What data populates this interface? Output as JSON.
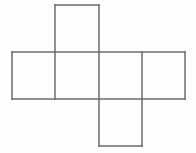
{
  "figure": {
    "type": "geometric-net",
    "shape_name": "cube net",
    "background_color": "#fdfdfd",
    "line_color": "#6b6b6b",
    "line_width": 1.5,
    "canvas": {
      "width": 196,
      "height": 153
    },
    "grid": {
      "cell_size": 43.3,
      "vertical_lines_x": [
        12,
        55,
        99,
        142,
        185
      ],
      "row_top_y": 5,
      "row_middle_top_y": 52,
      "row_middle_bottom_y": 99,
      "row_bottom_y": 146
    },
    "faces": [
      {
        "name": "top-face",
        "position": "top",
        "x": 55,
        "y": 5,
        "width": 44,
        "height": 47
      },
      {
        "name": "left-face",
        "position": "middle-1",
        "x": 12,
        "y": 52,
        "width": 43,
        "height": 47
      },
      {
        "name": "front-face",
        "position": "middle-2",
        "x": 55,
        "y": 52,
        "width": 44,
        "height": 47
      },
      {
        "name": "right-face",
        "position": "middle-3",
        "x": 99,
        "y": 52,
        "width": 43,
        "height": 47
      },
      {
        "name": "back-face",
        "position": "middle-4",
        "x": 142,
        "y": 52,
        "width": 43,
        "height": 47
      },
      {
        "name": "bottom-face",
        "position": "bottom",
        "x": 99,
        "y": 99,
        "width": 43,
        "height": 47
      }
    ],
    "edges": [
      {
        "name": "top-face-top-edge",
        "x1": 55,
        "y1": 5,
        "x2": 99,
        "y2": 5
      },
      {
        "name": "top-face-left-edge",
        "x1": 55,
        "y1": 5,
        "x2": 55,
        "y2": 52
      },
      {
        "name": "top-face-right-edge",
        "x1": 99,
        "y1": 5,
        "x2": 99,
        "y2": 52
      },
      {
        "name": "middle-row-top-edge",
        "x1": 12,
        "y1": 52,
        "x2": 185,
        "y2": 52
      },
      {
        "name": "middle-row-bottom-edge",
        "x1": 12,
        "y1": 99,
        "x2": 185,
        "y2": 99
      },
      {
        "name": "middle-divider-1",
        "x1": 12,
        "y1": 52,
        "x2": 12,
        "y2": 99
      },
      {
        "name": "middle-divider-2",
        "x1": 55,
        "y1": 52,
        "x2": 55,
        "y2": 99
      },
      {
        "name": "middle-divider-3",
        "x1": 99,
        "y1": 52,
        "x2": 99,
        "y2": 99
      },
      {
        "name": "middle-divider-4",
        "x1": 142,
        "y1": 52,
        "x2": 142,
        "y2": 99
      },
      {
        "name": "middle-divider-5",
        "x1": 185,
        "y1": 52,
        "x2": 185,
        "y2": 99
      },
      {
        "name": "bottom-face-left-edge",
        "x1": 99,
        "y1": 99,
        "x2": 99,
        "y2": 146
      },
      {
        "name": "bottom-face-right-edge",
        "x1": 142,
        "y1": 99,
        "x2": 142,
        "y2": 146
      },
      {
        "name": "bottom-face-bottom-edge",
        "x1": 99,
        "y1": 146,
        "x2": 142,
        "y2": 146
      }
    ],
    "labels": []
  }
}
